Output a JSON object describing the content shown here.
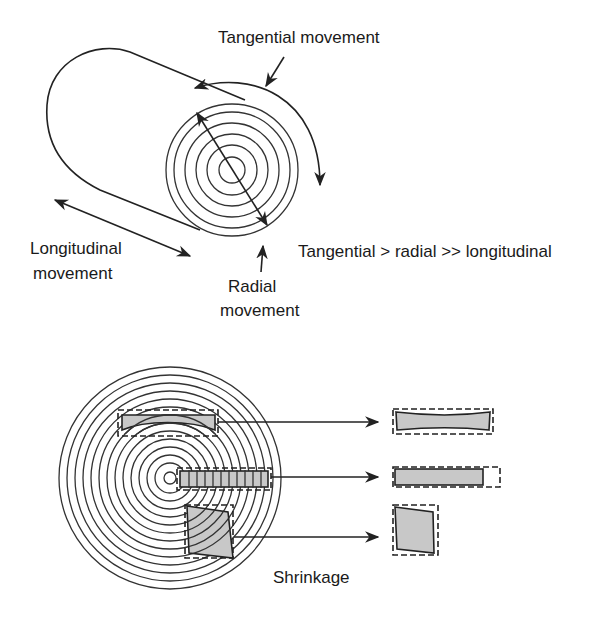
{
  "top_diagram": {
    "title": "Wood movement directions",
    "labels": {
      "tangential": "Tangential movement",
      "longitudinal_line1": "Longitudinal",
      "longitudinal_line2": "movement",
      "radial_line1": "Radial",
      "radial_line2": "movement",
      "relation": "Tangential > radial >> longitudinal"
    }
  },
  "bottom_diagram": {
    "caption": "Shrinkage",
    "pieces": [
      {
        "name": "flatsawn-board",
        "description": "tangential board cups"
      },
      {
        "name": "quartersawn-board",
        "description": "radial board shrinks in length less"
      },
      {
        "name": "square-piece",
        "description": "square distorts to rhombus"
      }
    ]
  },
  "colors": {
    "line": "#222222",
    "fill": "#c8c8c8",
    "background": "#ffffff"
  }
}
